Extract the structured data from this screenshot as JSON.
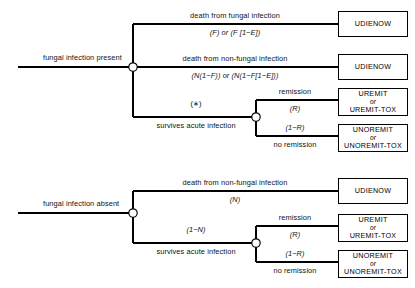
{
  "diagram": {
    "type": "decision-tree",
    "title": "",
    "root_branches": [
      {
        "id": "present",
        "label": "fungal infection present",
        "node": "chance-node",
        "branches": [
          {
            "id": "death-fungal",
            "label": "death from fungal infection",
            "probability": "(F) or (F [1−E])",
            "outcome": "UDIENOW"
          },
          {
            "id": "death-nonfungal",
            "label": "death from non-fungal infection",
            "probability": "(N(1−F)) or (N(1−F[1−E]))",
            "outcome": "UDIENOW"
          },
          {
            "id": "survives",
            "label": "survives acute infection",
            "probability": "(∗)",
            "branches": [
              {
                "id": "remission",
                "label": "remission",
                "probability": "(R)",
                "outcome_line1": "UREMIT",
                "outcome_or": "or",
                "outcome_line2": "UREMIT-TOX"
              },
              {
                "id": "no-remission",
                "label": "no remission",
                "probability": "(1−R)",
                "outcome_line1": "UNOREMIT",
                "outcome_or": "or",
                "outcome_line2": "UNOREMIT-TOX"
              }
            ]
          }
        ]
      },
      {
        "id": "absent",
        "label": "fungal infection absent",
        "node": "chance-node",
        "branches": [
          {
            "id": "death-nonfungal-absent",
            "label": "death from non-fungal infection",
            "probability": "(N)",
            "outcome": "UDIENOW"
          },
          {
            "id": "survives-absent",
            "label": "survives acute infection",
            "probability": "(1−N)",
            "branches": [
              {
                "id": "remission-absent",
                "label": "remission",
                "probability": "(R)",
                "outcome_line1": "UREMIT",
                "outcome_or": "or",
                "outcome_line2": "UREMIT-TOX"
              },
              {
                "id": "no-remission-absent",
                "label": "no remission",
                "probability": "(1−R)",
                "outcome_line1": "UNOREMIT",
                "outcome_or": "or",
                "outcome_line2": "UNOREMIT-TOX"
              }
            ]
          }
        ]
      }
    ],
    "colors": {
      "line": "#000000",
      "box_border": "#000000",
      "background": "#ffffff",
      "text": "#111111"
    }
  }
}
